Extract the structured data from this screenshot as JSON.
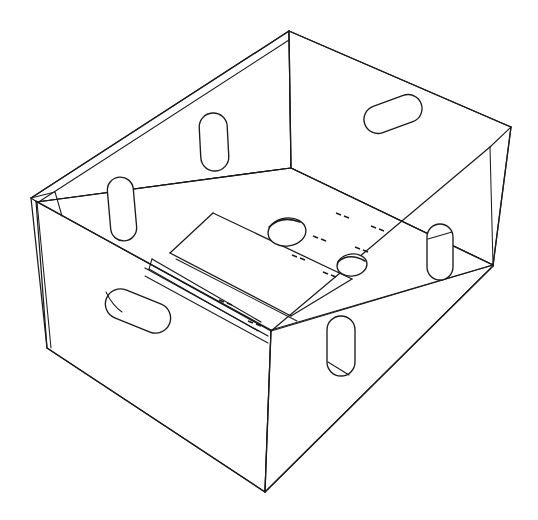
{
  "document": {
    "kind": "technical-line-drawing",
    "subject": "open-top corrugated crate / box",
    "view": "isometric perspective, viewed from above-front-left",
    "background_color": "#ffffff",
    "line_color": "#1b1b1b",
    "title": "",
    "caption": "",
    "labels": [],
    "dimensions_text": []
  },
  "geometry": {
    "canvas": {
      "width": 538,
      "height": 520
    },
    "key_points": {
      "top_back_corner": [
        289,
        31
      ],
      "top_left_corner": [
        31,
        198
      ],
      "top_right_corner": [
        511,
        127
      ],
      "inner_floor_back": [
        291,
        168
      ],
      "bottom_left_corner": [
        47,
        348
      ],
      "bottom_front_corner": [
        265,
        492
      ],
      "bottom_right_corner": [
        493,
        266
      ]
    },
    "walls": [
      {
        "name": "back-left-wall",
        "visible_face": "inner"
      },
      {
        "name": "back-right-wall",
        "visible_face": "inner"
      },
      {
        "name": "front-left-wall",
        "visible_face": "outer"
      },
      {
        "name": "front-right-wall",
        "visible_face": "outer"
      }
    ]
  },
  "features": {
    "handle_slots": [
      {
        "id": "slot-back-left-lower",
        "wall": "back-left-wall",
        "shape": "stadium-vertical",
        "cx": 122,
        "cy": 209,
        "rx": 13,
        "ry": 32,
        "rot": -6
      },
      {
        "id": "slot-back-left-upper",
        "wall": "back-left-wall",
        "shape": "stadium-vertical",
        "cx": 214,
        "cy": 142,
        "rx": 14,
        "ry": 29,
        "rot": -3
      },
      {
        "id": "slot-back-right",
        "wall": "back-right-wall",
        "shape": "stadium-horizontal",
        "cx": 393,
        "cy": 114,
        "rx": 30,
        "ry": 14,
        "rot": -22
      },
      {
        "id": "slot-right-side",
        "wall": "back-right-wall",
        "shape": "stadium-vertical",
        "cx": 440,
        "cy": 252,
        "rx": 13,
        "ry": 28,
        "rot": 0
      },
      {
        "id": "slot-front-right",
        "wall": "front-right-wall",
        "shape": "stadium-vertical",
        "cx": 341,
        "cy": 346,
        "rx": 14,
        "ry": 30,
        "rot": 0
      },
      {
        "id": "slot-front-left",
        "wall": "front-left-wall",
        "shape": "stadium-horizontal",
        "cx": 138,
        "cy": 311,
        "rx": 35,
        "ry": 15,
        "rot": 22
      }
    ],
    "floor_holes": [
      {
        "id": "floor-hole-upper",
        "cx": 287,
        "cy": 232,
        "rx": 19,
        "ry": 14
      },
      {
        "id": "floor-hole-lower",
        "cx": 352,
        "cy": 265,
        "rx": 15,
        "ry": 11
      }
    ],
    "perforation_marks": {
      "count": 14,
      "description": "small paired dash marks scored into the floor and front base strip"
    }
  },
  "colors": {
    "stroke": "#1b1b1b",
    "background": "#ffffff"
  }
}
